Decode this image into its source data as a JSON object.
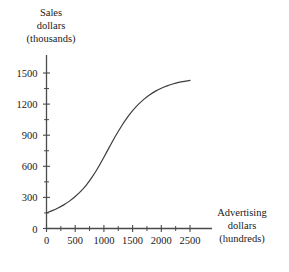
{
  "chart_data": {
    "type": "line",
    "title": "",
    "subtitle": "",
    "xlabel_lines": [
      "Advertising",
      "dollars",
      "(hundreds)"
    ],
    "ylabel_lines": [
      "Sales",
      "dollars",
      "(thousands)"
    ],
    "xlabel": "Advertising dollars (hundreds)",
    "ylabel": "Sales dollars (thousands)",
    "xlim": [
      0,
      2750
    ],
    "ylim": [
      0,
      1600
    ],
    "x_major_ticks": [
      0,
      500,
      1000,
      1500,
      2000,
      2500
    ],
    "x_major_tick_labels": [
      "0",
      "500",
      "1000",
      "1500",
      "2000",
      "2500"
    ],
    "x_minor_ticks": [
      250,
      750,
      1250,
      1750,
      2250
    ],
    "y_major_ticks": [
      0,
      300,
      600,
      900,
      1200,
      1500
    ],
    "y_major_tick_labels": [
      "0",
      "300",
      "600",
      "900",
      "1200",
      "1500"
    ],
    "y_minor_ticks": [
      150,
      450,
      750,
      1050,
      1350
    ],
    "grid": false,
    "legend": false,
    "legend_position": "none",
    "series": [
      {
        "name": "Sales response curve",
        "color": "#3d3d3d",
        "line_width": 1.2,
        "x": [
          0,
          100,
          200,
          300,
          400,
          500,
          600,
          700,
          800,
          900,
          1000,
          1100,
          1200,
          1300,
          1400,
          1500,
          1600,
          1700,
          1800,
          1900,
          2000,
          2100,
          2200,
          2300,
          2400,
          2500
        ],
        "y": [
          150,
          172,
          198,
          228,
          264,
          308,
          360,
          424,
          500,
          588,
          688,
          790,
          890,
          982,
          1064,
          1136,
          1197,
          1248,
          1290,
          1325,
          1353,
          1376,
          1394,
          1409,
          1420,
          1428
        ]
      }
    ],
    "annotations": [],
    "axis_color": "#4a4a4a",
    "text_color": "#1a1a1a",
    "background_color": "#ffffff"
  },
  "figure": {
    "name": "sales-vs-advertising-curve"
  }
}
